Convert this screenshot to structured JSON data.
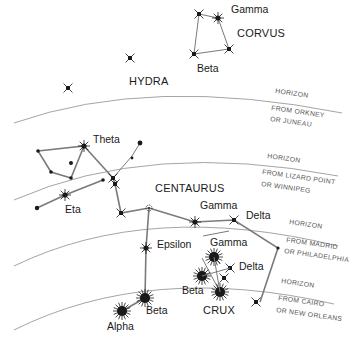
{
  "diagram": {
    "colors": {
      "ink": "#1a1a1a",
      "line": "#7a7a7a",
      "horizon": "#9a9a9a",
      "label_muted": "#555555"
    },
    "constellations": [
      {
        "id": "corvus",
        "name": "CORVUS"
      },
      {
        "id": "hydra",
        "name": "HYDRA"
      },
      {
        "id": "centaurus",
        "name": "CENTAURUS"
      },
      {
        "id": "crux",
        "name": "CRUX"
      }
    ],
    "star_labels": {
      "corvus_gamma": "Gamma",
      "corvus_beta": "Beta",
      "centaurus_theta": "Theta",
      "centaurus_eta": "Eta",
      "centaurus_gamma": "Gamma",
      "centaurus_delta": "Delta",
      "centaurus_epsilon": "Epsilon",
      "centaurus_beta": "Beta",
      "centaurus_alpha": "Alpha",
      "crux_gamma": "Gamma",
      "crux_delta": "Delta",
      "crux_beta": "Beta"
    },
    "horizons": [
      {
        "label": "HORIZON",
        "line1": "FROM ORKNEY",
        "line2": "OR JUNEAU"
      },
      {
        "label": "HORIZON",
        "line1": "FROM LIZARD POINT",
        "line2": "OR WINNIPEG"
      },
      {
        "label": "HORIZON",
        "line1": "FROM MADRID",
        "line2": "OR PHILADELPHIA"
      },
      {
        "label": "HORIZON",
        "line1": "FROM CAIRO",
        "line2": "OR NEW ORLEANS"
      }
    ]
  }
}
